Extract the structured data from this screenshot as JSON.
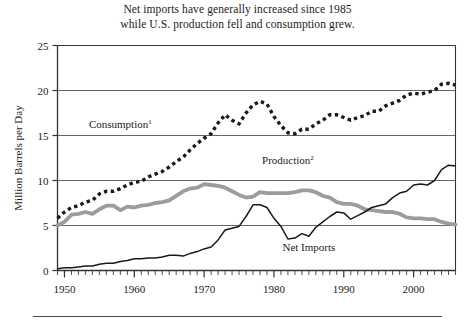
{
  "figure": {
    "title_line1": "Net imports have generally increased since 1985",
    "title_line2": "while U.S. production fell and consumption grew.",
    "footnote_rule": true
  },
  "chart_data": {
    "type": "line",
    "title": "Net imports have generally increased since 1985 while U.S. production fell and consumption grew.",
    "xlabel": "",
    "ylabel": "Million Barrels per Day",
    "xlim": [
      1949,
      2006
    ],
    "ylim": [
      0,
      25
    ],
    "yticks": [
      0,
      5,
      10,
      15,
      20,
      25
    ],
    "ytick_labels": [
      "0",
      "5",
      "10",
      "15",
      "20",
      "25"
    ],
    "xticks": [
      1950,
      1960,
      1970,
      1980,
      1990,
      2000
    ],
    "xtick_labels": [
      "1950",
      "1960",
      "1970",
      "1980",
      "1990",
      "2000"
    ],
    "minor_xtick_interval": 1,
    "grid": "horizontal",
    "legend": "inline-labels",
    "x": [
      1949,
      1950,
      1951,
      1952,
      1953,
      1954,
      1955,
      1956,
      1957,
      1958,
      1959,
      1960,
      1961,
      1962,
      1963,
      1964,
      1965,
      1966,
      1967,
      1968,
      1969,
      1970,
      1971,
      1972,
      1973,
      1974,
      1975,
      1976,
      1977,
      1978,
      1979,
      1980,
      1981,
      1982,
      1983,
      1984,
      1985,
      1986,
      1987,
      1988,
      1989,
      1990,
      1991,
      1992,
      1993,
      1994,
      1995,
      1996,
      1997,
      1998,
      1999,
      2000,
      2001,
      2002,
      2003,
      2004,
      2005,
      2006
    ],
    "series": [
      {
        "name": "Consumption",
        "label": "Consumption",
        "superscript": "1",
        "style": "dotted",
        "color": "#1a1a1a",
        "label_x": 1958,
        "label_y": 15.8,
        "values": [
          5.8,
          6.5,
          7.0,
          7.2,
          7.6,
          7.8,
          8.5,
          8.8,
          8.8,
          9.1,
          9.5,
          9.8,
          9.9,
          10.4,
          10.7,
          11.0,
          11.5,
          12.1,
          12.6,
          13.4,
          14.1,
          14.7,
          15.2,
          16.4,
          17.3,
          16.7,
          16.3,
          17.5,
          18.4,
          18.8,
          18.5,
          17.1,
          16.1,
          15.3,
          15.2,
          15.7,
          15.7,
          16.3,
          16.7,
          17.3,
          17.3,
          17.0,
          16.7,
          17.0,
          17.2,
          17.7,
          17.7,
          18.3,
          18.6,
          18.9,
          19.5,
          19.7,
          19.6,
          19.8,
          20.0,
          20.7,
          20.8,
          20.6
        ]
      },
      {
        "name": "Production",
        "label": "Production",
        "superscript": "2",
        "style": "thick-gray",
        "color": "#9c9c9c",
        "label_x": 1982,
        "label_y": 11.8,
        "values": [
          5.0,
          5.4,
          6.2,
          6.3,
          6.5,
          6.3,
          6.8,
          7.2,
          7.2,
          6.7,
          7.1,
          7.0,
          7.2,
          7.3,
          7.5,
          7.6,
          7.8,
          8.3,
          8.8,
          9.1,
          9.2,
          9.6,
          9.5,
          9.4,
          9.2,
          8.8,
          8.4,
          8.1,
          8.2,
          8.7,
          8.6,
          8.6,
          8.6,
          8.6,
          8.7,
          8.9,
          8.9,
          8.7,
          8.3,
          8.1,
          7.6,
          7.4,
          7.4,
          7.2,
          6.8,
          6.7,
          6.6,
          6.5,
          6.5,
          6.3,
          5.9,
          5.8,
          5.8,
          5.7,
          5.7,
          5.4,
          5.2,
          5.1
        ]
      },
      {
        "name": "Net Imports",
        "label": "Net Imports",
        "style": "thin-black",
        "color": "#1a1a1a",
        "label_x": 1985,
        "label_y": 2.2,
        "values": [
          0.2,
          0.3,
          0.3,
          0.4,
          0.5,
          0.5,
          0.7,
          0.8,
          0.8,
          1.0,
          1.1,
          1.3,
          1.3,
          1.4,
          1.4,
          1.5,
          1.7,
          1.7,
          1.6,
          1.9,
          2.1,
          2.4,
          2.6,
          3.4,
          4.5,
          4.7,
          4.9,
          6.0,
          7.3,
          7.3,
          7.0,
          5.8,
          4.9,
          3.5,
          3.6,
          4.1,
          3.8,
          4.8,
          5.4,
          6.0,
          6.5,
          6.4,
          5.7,
          6.1,
          6.5,
          7.0,
          7.2,
          7.4,
          8.1,
          8.6,
          8.8,
          9.5,
          9.6,
          9.5,
          10.0,
          11.2,
          11.7,
          11.6
        ]
      }
    ]
  },
  "axes": {
    "y_title": "Million Barrels per Day"
  }
}
